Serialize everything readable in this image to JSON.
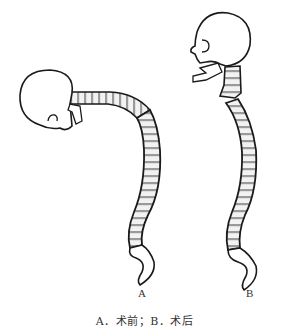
{
  "figure": {
    "panels": [
      {
        "id": "A",
        "label": "A",
        "description": "Spine with severe kyphosis, head bent forward"
      },
      {
        "id": "B",
        "label": "B",
        "description": "Spine corrected, head upright"
      }
    ],
    "caption": "A．术前；B．术后",
    "colors": {
      "outline": "#1a1a1a",
      "vertebra_fill": "#d8d8d8",
      "disc_fill": "#f4f4f4",
      "background": "#ffffff"
    }
  }
}
